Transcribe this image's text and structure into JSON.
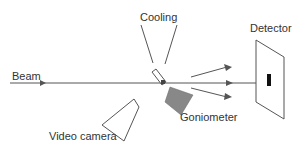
{
  "diagram": {
    "labels": {
      "cooling": "Cooling",
      "detector": "Detector",
      "beam": "Beam",
      "goniometer": "Goniometer",
      "video_camera": "Video camera"
    },
    "colors": {
      "line": "#555555",
      "goniometer_fill": "#888888",
      "detector_spot": "#111111"
    }
  }
}
